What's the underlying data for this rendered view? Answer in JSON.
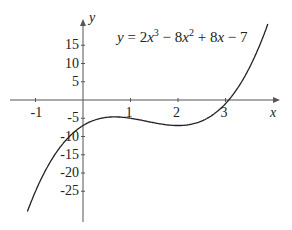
{
  "chart_data": {
    "type": "line",
    "title_parts": {
      "pre": "y = 2x",
      "sup1": "3",
      "mid": " − 8x",
      "sup2": "2",
      "post": " + 8x − 7"
    },
    "xlabel": "x",
    "ylabel": "y",
    "x_ticks": [
      "-1",
      "1",
      "2",
      "3"
    ],
    "y_ticks": [
      "15",
      "10",
      "5",
      "-5",
      "-10",
      "-15",
      "-20",
      "-25"
    ],
    "xlim": [
      -1.2,
      4
    ],
    "ylim": [
      -32,
      26
    ],
    "grid": false,
    "series": [
      {
        "name": "f(x)",
        "coefficients": [
          2,
          -8,
          8,
          -7
        ],
        "x": [
          -1.15,
          0,
          0.67,
          2,
          3,
          3.6
        ],
        "values": [
          -30,
          -7,
          -4.6,
          -7,
          -1,
          9.5
        ]
      }
    ]
  }
}
